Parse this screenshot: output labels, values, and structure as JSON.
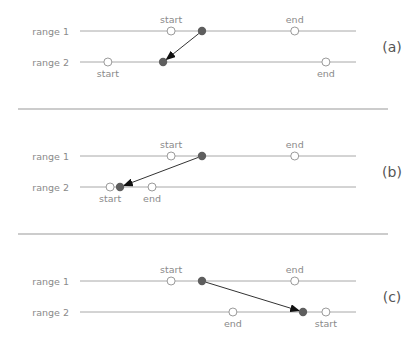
{
  "range_labels": [
    "range 1",
    "range 2"
  ],
  "panels": [
    {
      "tag": "(a)",
      "range1": {
        "start": {
          "label": "start",
          "pos": 0.33
        },
        "end": {
          "label": "end",
          "pos": 0.778
        },
        "point": 0.442
      },
      "range2": {
        "start": {
          "label": "start",
          "pos": 0.101
        },
        "end": {
          "label": "end",
          "pos": 0.891
        },
        "point": 0.301
      },
      "r2_labels_below": true
    },
    {
      "tag": "(b)",
      "range1": {
        "start": {
          "label": "start",
          "pos": 0.33
        },
        "end": {
          "label": "end",
          "pos": 0.778
        },
        "point": 0.442
      },
      "range2": {
        "start": {
          "label": "start",
          "pos": 0.109
        },
        "end": {
          "label": "end",
          "pos": 0.261
        },
        "point": 0.145
      },
      "r2_labels_below": true
    },
    {
      "tag": "(c)",
      "range1": {
        "start": {
          "label": "start",
          "pos": 0.33
        },
        "end": {
          "label": "end",
          "pos": 0.778
        },
        "point": 0.442
      },
      "range2": {
        "start": {
          "label": "start",
          "pos": 0.891
        },
        "end": {
          "label": "end",
          "pos": 0.554
        },
        "point": 0.808
      },
      "r2_labels_below": true
    }
  ]
}
